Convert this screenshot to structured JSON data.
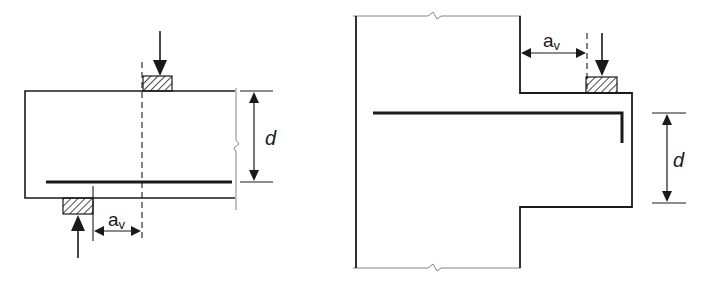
{
  "figures": [
    {
      "name": "short-span-beam",
      "labels": {
        "a_main": "a",
        "a_sub": "v",
        "d": "d"
      }
    },
    {
      "name": "corbel",
      "labels": {
        "a_main": "a",
        "a_sub": "v",
        "d": "d"
      }
    }
  ],
  "colors": {
    "line": "#1a1a1a",
    "thin_line": "#555555",
    "background": "#ffffff"
  }
}
